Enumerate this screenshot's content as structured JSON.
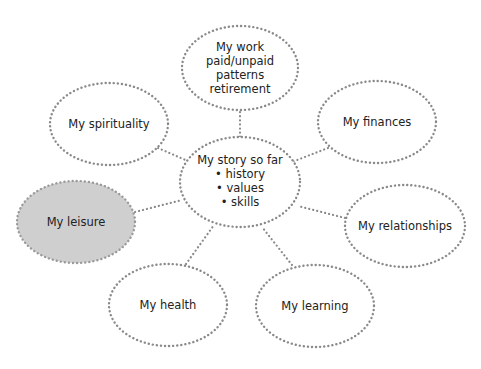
{
  "diagram": {
    "colors": {
      "stroke": "#8a8a8a",
      "highlight_fill": "#cfcfcf",
      "text": "#222222"
    },
    "center": {
      "lines": [
        "My story so far",
        "• history",
        "• values",
        "• skills"
      ]
    },
    "nodes": [
      {
        "id": "work",
        "lines": [
          "My work",
          "paid/unpaid",
          "patterns",
          "retirement"
        ]
      },
      {
        "id": "spirituality",
        "lines": [
          "My spirituality"
        ]
      },
      {
        "id": "finances",
        "lines": [
          "My finances"
        ]
      },
      {
        "id": "leisure",
        "lines": [
          "My leisure"
        ],
        "highlighted": true
      },
      {
        "id": "relationships",
        "lines": [
          "My relationships"
        ]
      },
      {
        "id": "health",
        "lines": [
          "My health"
        ]
      },
      {
        "id": "learning",
        "lines": [
          "My learning"
        ]
      }
    ]
  }
}
